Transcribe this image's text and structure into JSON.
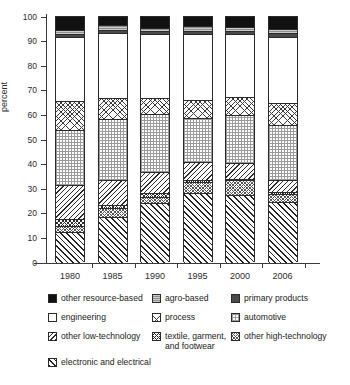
{
  "chart_data": {
    "type": "bar",
    "stacked": true,
    "title": "",
    "xlabel": "",
    "ylabel": "percent",
    "ylim": [
      0,
      100
    ],
    "yticks": [
      0,
      10,
      20,
      30,
      40,
      50,
      60,
      70,
      80,
      90,
      100
    ],
    "grid": false,
    "legend_position": "bottom",
    "categories": [
      "1980",
      "1985",
      "1990",
      "1995",
      "2000",
      "2006"
    ],
    "series": [
      {
        "name": "electronic and electrical",
        "pattern": "diagonal-hatch-heavy",
        "color": "#ffffff",
        "values": [
          12.0,
          18.3,
          23.8,
          27.9,
          27.4,
          24.5
        ]
      },
      {
        "name": "other high-technology",
        "pattern": "fine-crosshatch-gray",
        "color": "#ffffff",
        "values": [
          2.6,
          3.6,
          2.4,
          4.5,
          5.8,
          3.3
        ]
      },
      {
        "name": "textile, garment, and footwear",
        "pattern": "dense-crosshatch",
        "color": "#ffffff",
        "values": [
          2.9,
          1.3,
          1.8,
          0.9,
          0.6,
          0.6
        ]
      },
      {
        "name": "other low-technology",
        "pattern": "diagonal-hatch-light",
        "color": "#ffffff",
        "values": [
          13.8,
          10.3,
          8.7,
          7.2,
          6.6,
          4.8
        ]
      },
      {
        "name": "automotive",
        "pattern": "fine-dot-grid",
        "color": "#ffffff",
        "values": [
          22.3,
          24.8,
          23.3,
          18.2,
          19.2,
          22.6
        ]
      },
      {
        "name": "process",
        "pattern": "medium-crosshatch",
        "color": "#ffffff",
        "values": [
          11.9,
          8.4,
          6.7,
          7.2,
          7.4,
          9.0
        ]
      },
      {
        "name": "engineering",
        "pattern": "open-white",
        "color": "#ffffff",
        "values": [
          26.0,
          26.3,
          26.0,
          26.8,
          25.6,
          26.7
        ]
      },
      {
        "name": "primary products",
        "pattern": "solid-dark-gray",
        "color": "#4a4a4a",
        "values": [
          1.2,
          1.3,
          1.1,
          1.3,
          1.2,
          1.4
        ]
      },
      {
        "name": "agro-based",
        "pattern": "solid-mid-gray",
        "color": "#8f8f8f",
        "values": [
          1.8,
          2.1,
          1.5,
          2.1,
          1.6,
          1.9
        ]
      },
      {
        "name": "other resource-based",
        "pattern": "solid-black",
        "color": "#111111",
        "values": [
          5.5,
          3.6,
          4.7,
          3.9,
          4.6,
          5.2
        ]
      }
    ]
  },
  "axis": {
    "y_title": "percent",
    "y_tick_labels": [
      "0",
      "10",
      "20",
      "30",
      "40",
      "50",
      "60",
      "70",
      "80",
      "90",
      "100"
    ],
    "x_tick_labels": [
      "1980",
      "1985",
      "1990",
      "1995",
      "2000",
      "2006"
    ]
  },
  "legend": {
    "entries": [
      {
        "label": "other resource-based",
        "swatch": "solid-black"
      },
      {
        "label": "agro-based",
        "swatch": "solid-mid-gray"
      },
      {
        "label": "primary products",
        "swatch": "solid-dark-gray"
      },
      {
        "label": "engineering",
        "swatch": "open-white"
      },
      {
        "label": "process",
        "swatch": "medium-crosshatch"
      },
      {
        "label": "automotive",
        "swatch": "fine-dot-grid"
      },
      {
        "label": "other low-technology",
        "swatch": "diagonal-hatch-light"
      },
      {
        "label": "textile, garment,\nand footwear",
        "swatch": "dense-crosshatch"
      },
      {
        "label": "other high-technology",
        "swatch": "fine-crosshatch-gray"
      },
      {
        "label": "electronic and electrical",
        "swatch": "diagonal-hatch-heavy"
      }
    ]
  }
}
